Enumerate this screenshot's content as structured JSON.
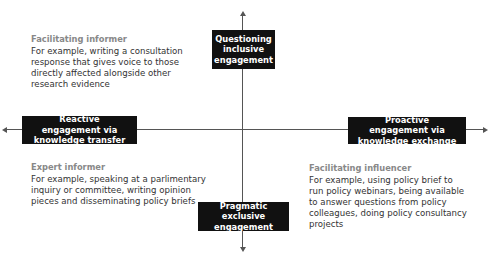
{
  "axes": {
    "top_label": "Questioning inclusive engagement",
    "bottom_label": "Pragmatic exclusive engagement",
    "left_label": "Reactive engagement via knowledge transfer",
    "right_label": "Proactive engagement via knowledge exchange"
  },
  "quadrants": {
    "top_left": {
      "title": "Facilitating informer",
      "text": "For example, writing a consultation response that gives voice to those directly affected alongside other research evidence"
    },
    "bottom_left": {
      "title": "Expert informer",
      "text": "For example, speaking at a parlimentary inquiry or committee, writing opinion pieces and disseminating policy briefs"
    },
    "bottom_right": {
      "title": "Facilitating influencer",
      "text": "For example, using policy brief to run policy webinars, being available to answer questions from policy colleagues, doing policy consultancy projects"
    }
  },
  "colors": {
    "box_bg": "#111111",
    "box_text": "#ffffff",
    "axis": "#555555",
    "title_gray": "#888888",
    "body_text": "#333333"
  }
}
